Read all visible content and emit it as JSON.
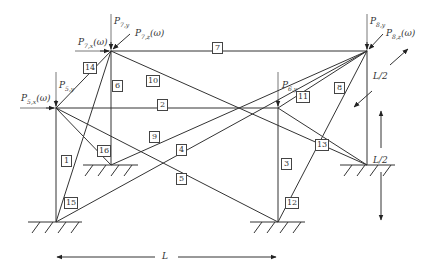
{
  "diagram": {
    "type": "3D truss structure with harmonic loads",
    "nodes": {
      "n5": {
        "x": 56,
        "y": 108
      },
      "n6": {
        "x": 278,
        "y": 108
      },
      "n7": {
        "x": 111,
        "y": 51
      },
      "n8": {
        "x": 367,
        "y": 51
      },
      "g1": {
        "x": 56,
        "y": 222
      },
      "g2": {
        "x": 278,
        "y": 222
      },
      "g3": {
        "x": 111,
        "y": 165
      },
      "g4": {
        "x": 367,
        "y": 165
      }
    },
    "members": [
      {
        "id": "1",
        "from": "n5",
        "to": "g1",
        "label_pos": [
          61,
          155
        ]
      },
      {
        "id": "2",
        "from": "n5",
        "to": "n6",
        "label_pos": [
          157,
          99
        ]
      },
      {
        "id": "3",
        "from": "n6",
        "to": "g2",
        "label_pos": [
          281,
          158
        ]
      },
      {
        "id": "4",
        "from": "g1",
        "to": "n8",
        "label_pos": [
          176,
          144
        ]
      },
      {
        "id": "5",
        "from": "n5",
        "to": "g2",
        "label_pos": [
          176,
          173
        ]
      },
      {
        "id": "6",
        "from": "n7",
        "to": "g3",
        "label_pos": [
          112,
          80
        ]
      },
      {
        "id": "7",
        "from": "n7",
        "to": "n8",
        "label_pos": [
          212,
          42
        ]
      },
      {
        "id": "8",
        "from": "n8",
        "to": "g4",
        "label_pos": [
          334,
          82
        ]
      },
      {
        "id": "9",
        "from": "g3",
        "to": "n6",
        "label_pos": [
          149,
          131
        ]
      },
      {
        "id": "10",
        "from": "n7",
        "to": "g4",
        "label_pos": [
          146,
          75
        ]
      },
      {
        "id": "11",
        "from": "n6",
        "to": "n8",
        "label_pos": [
          296,
          91
        ]
      },
      {
        "id": "12",
        "from": "g2",
        "to": "n8",
        "label_pos": [
          285,
          197
        ]
      },
      {
        "id": "13",
        "from": "n6",
        "to": "g4",
        "label_pos": [
          315,
          139
        ]
      },
      {
        "id": "14",
        "from": "n5",
        "to": "n7",
        "label_pos": [
          83,
          62
        ]
      },
      {
        "id": "15",
        "from": "g1",
        "to": "n7",
        "label_pos": [
          64,
          197
        ]
      },
      {
        "id": "16",
        "from": "n5",
        "to": "g3",
        "label_pos": [
          97,
          145
        ]
      }
    ],
    "loads": [
      {
        "id": "P7y",
        "text": "P",
        "sub": "7,y",
        "suffix": "",
        "pos": [
          114,
          17
        ]
      },
      {
        "id": "P7x",
        "text": "P",
        "sub": "7,x",
        "suffix": "(ω)",
        "pos": [
          78,
          38
        ]
      },
      {
        "id": "P7z",
        "text": "P",
        "sub": "7,z",
        "suffix": "(ω)",
        "pos": [
          135,
          29
        ]
      },
      {
        "id": "P5y",
        "text": "P",
        "sub": "5,y",
        "suffix": "",
        "pos": [
          59,
          81
        ]
      },
      {
        "id": "P5x",
        "text": "P",
        "sub": "5,x",
        "suffix": "(ω)",
        "pos": [
          21,
          94
        ]
      },
      {
        "id": "P6y",
        "text": "P",
        "sub": "6,y",
        "suffix": "",
        "pos": [
          282,
          81
        ]
      },
      {
        "id": "P8y",
        "text": "P",
        "sub": "8,y",
        "suffix": "",
        "pos": [
          370,
          17
        ]
      },
      {
        "id": "P8z",
        "text": "P",
        "sub": "8,z",
        "suffix": "(ω)",
        "pos": [
          386,
          29
        ]
      }
    ],
    "dimensions": {
      "width_label": "L",
      "depth_label": "L/2",
      "height_label": "L/2"
    }
  }
}
